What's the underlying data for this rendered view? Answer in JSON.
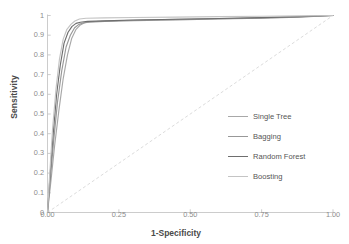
{
  "chart_data": {
    "type": "line",
    "title": "",
    "xlabel": "1-Specificity",
    "ylabel": "Sensitivity",
    "xlim": [
      0,
      1
    ],
    "ylim": [
      0,
      1
    ],
    "grid": false,
    "legend_position": "right",
    "xticks": [
      "0.00",
      "0.25",
      "0.50",
      "0.75",
      "1.00"
    ],
    "xtick_values": [
      0,
      0.25,
      0.5,
      0.75,
      1
    ],
    "yticks": [
      "0",
      "0.1",
      "0.2",
      "0.3",
      "0.4",
      "0.5",
      "0.6",
      "0.7",
      "0.8",
      "0.9",
      "1"
    ],
    "ytick_values": [
      0,
      0.1,
      0.2,
      0.3,
      0.4,
      0.5,
      0.6,
      0.7,
      0.8,
      0.9,
      1
    ],
    "series": [
      {
        "name": "Single Tree",
        "color": "#a8a8a8",
        "x": [
          0,
          0.012,
          0.025,
          0.04,
          0.055,
          0.07,
          0.085,
          0.1,
          0.115,
          0.13,
          0.15,
          0.2,
          0.3,
          0.45,
          0.6,
          0.75,
          0.88,
          1
        ],
        "y": [
          0,
          0.16,
          0.34,
          0.52,
          0.68,
          0.8,
          0.885,
          0.93,
          0.952,
          0.963,
          0.968,
          0.972,
          0.976,
          0.98,
          0.984,
          0.988,
          0.993,
          1
        ]
      },
      {
        "name": "Bagging",
        "color": "#989898",
        "x": [
          0,
          0.01,
          0.022,
          0.035,
          0.05,
          0.065,
          0.08,
          0.095,
          0.11,
          0.125,
          0.145,
          0.2,
          0.3,
          0.45,
          0.6,
          0.75,
          0.88,
          1
        ],
        "y": [
          0,
          0.17,
          0.37,
          0.56,
          0.72,
          0.84,
          0.9,
          0.938,
          0.955,
          0.962,
          0.966,
          0.97,
          0.974,
          0.978,
          0.982,
          0.987,
          0.992,
          1
        ]
      },
      {
        "name": "Random Forest",
        "color": "#6e6e6e",
        "x": [
          0,
          0.009,
          0.02,
          0.032,
          0.045,
          0.058,
          0.072,
          0.086,
          0.1,
          0.115,
          0.14,
          0.2,
          0.3,
          0.45,
          0.6,
          0.75,
          0.88,
          1
        ],
        "y": [
          0,
          0.19,
          0.4,
          0.6,
          0.75,
          0.86,
          0.915,
          0.945,
          0.96,
          0.966,
          0.97,
          0.973,
          0.977,
          0.981,
          0.985,
          0.989,
          0.994,
          1
        ]
      },
      {
        "name": "Boosting",
        "color": "#c4c4c4",
        "x": [
          0,
          0.008,
          0.018,
          0.03,
          0.042,
          0.055,
          0.068,
          0.082,
          0.096,
          0.112,
          0.135,
          0.2,
          0.3,
          0.45,
          0.6,
          0.75,
          0.88,
          1
        ],
        "y": [
          0,
          0.2,
          0.43,
          0.63,
          0.78,
          0.88,
          0.93,
          0.955,
          0.972,
          0.982,
          0.986,
          0.988,
          0.99,
          0.992,
          0.994,
          0.996,
          0.998,
          1
        ]
      }
    ],
    "reference_line": {
      "name": "chance-diagonal",
      "style": "dashed",
      "color": "#dcdcdc",
      "x": [
        0,
        1
      ],
      "y": [
        0,
        1
      ]
    }
  },
  "legend": {
    "items": [
      {
        "label": "Single Tree",
        "color": "#a8a8a8"
      },
      {
        "label": "Bagging",
        "color": "#989898"
      },
      {
        "label": "Random Forest",
        "color": "#6e6e6e"
      },
      {
        "label": "Boosting",
        "color": "#c4c4c4"
      }
    ]
  },
  "axes": {
    "x_title": "1-Specificity",
    "y_title": "Sensitivity",
    "axis_color": "#bfbfbf"
  }
}
